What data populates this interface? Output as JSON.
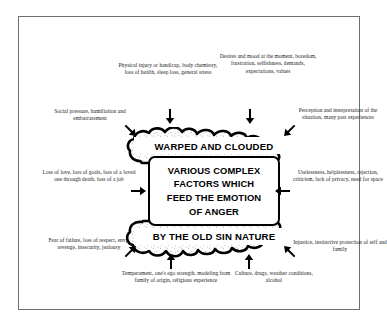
{
  "diagram": {
    "title": "Various Complex Factors Which Feed The Emotion Of Anger",
    "frame_border_color": "#6e6e72",
    "ink_color": "#000000",
    "background_color": "#ffffff",
    "center": {
      "top_cloud_label": "WARPED AND CLOUDED",
      "bottom_cloud_label": "BY THE OLD SIN NATURE",
      "core_lines": [
        "VARIOUS COMPLEX",
        "FACTORS WHICH",
        "FEED THE EMOTION",
        "OF ANGER"
      ]
    },
    "factors": [
      {
        "id": "physical",
        "position": "top-left",
        "text": "Physical injury or handicap, body chemistry, loss of health, sleep loss, general stress",
        "arrow": "arrow-down"
      },
      {
        "id": "desires",
        "position": "top-right",
        "text": "Desires and mood at the moment, boredom, frustration, selfishness, demands, expectations, values",
        "arrow": "arrow-down"
      },
      {
        "id": "social-pressure",
        "position": "left-upper",
        "text": "Social pressure, humiliation and embarrassment",
        "arrow": "arrow-down-right"
      },
      {
        "id": "perception",
        "position": "right-upper",
        "text": "Perception and interpretation of the situation, many past experiences",
        "arrow": "arrow-down-left"
      },
      {
        "id": "loss",
        "position": "left-middle",
        "text": "Loss of love, loss of goals, loss of a loved one through death, loss of a job",
        "arrow": "arrow-right"
      },
      {
        "id": "uselessness",
        "position": "right-middle",
        "text": "Uselessness, helplessness, rejection, criticism, lack of privacy, need for space",
        "arrow": "arrow-left"
      },
      {
        "id": "fear",
        "position": "left-lower",
        "text": "Fear of failure, loss of respect, envy, revenge, insecurity, jealousy",
        "arrow": "arrow-up-right"
      },
      {
        "id": "injustice",
        "position": "right-lower",
        "text": "Injustice, instinctive protection of self and family",
        "arrow": "arrow-up-left"
      },
      {
        "id": "temperament",
        "position": "bottom-left",
        "text": "Temperament, one's ego strength, modeling from family of origin, religious experience",
        "arrow": "arrow-up"
      },
      {
        "id": "culture",
        "position": "bottom-right",
        "text": "Culture, drugs, weather conditions, alcohol",
        "arrow": "arrow-up"
      }
    ]
  }
}
